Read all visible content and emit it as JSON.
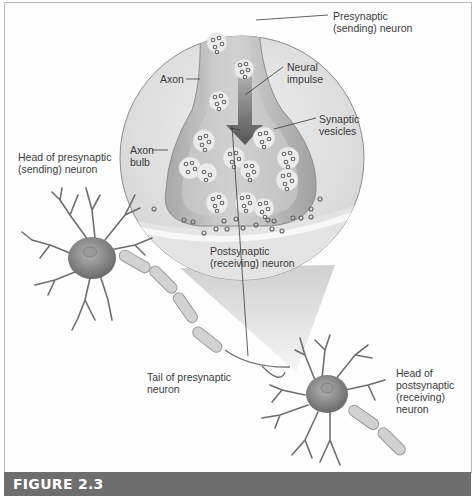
{
  "figure": {
    "caption_label": "FIGURE 2.3"
  },
  "labels": {
    "presynaptic_neuron": "Presynaptic\n(sending) neuron",
    "axon": "Axon",
    "neural_impulse": "Neural\nimpulse",
    "synaptic_vesicles": "Synaptic\nvesicles",
    "axon_bulb": "Axon\nbulb",
    "head_presynaptic": "Head of presynaptic\n(sending) neuron",
    "postsynaptic_neuron": "Postsynaptic\n(receiving) neuron",
    "tail_presynaptic": "Tail of presynaptic\nneuron",
    "head_postsynaptic": "Head of\npostsynaptic\n(receiving)\nneuron"
  },
  "colors": {
    "figure_bar": "#6e6e6e",
    "circle_bg": "#e6e6e6",
    "axon_fill": "#c4c4c4",
    "bulb_dark": "#9d9d9d",
    "vesicle_fill": "#ececec",
    "neurotransmitter": "#707070",
    "neuron_body": "#8a8a8a",
    "myelin": "#d0d0d0",
    "text": "#3a3a3a"
  }
}
